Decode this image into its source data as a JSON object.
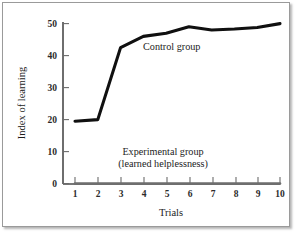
{
  "chart_data": {
    "type": "line",
    "title": "",
    "xlabel": "Trials",
    "ylabel": "Index of learning",
    "x": [
      1,
      2,
      3,
      4,
      5,
      6,
      7,
      8,
      9,
      10
    ],
    "xtick_labels": [
      "1",
      "2",
      "3",
      "4",
      "5",
      "6",
      "7",
      "8",
      "9",
      "10"
    ],
    "ytick_labels": [
      "0",
      "10",
      "20",
      "30",
      "40",
      "50"
    ],
    "yticks": [
      0,
      10,
      20,
      30,
      40,
      50
    ],
    "xlim": [
      1,
      10
    ],
    "ylim": [
      0,
      50
    ],
    "grid": false,
    "legend_position": "inline-annotation",
    "series": [
      {
        "name": "Control group",
        "values": [
          19.5,
          20.0,
          42.5,
          46.0,
          47.0,
          49.0,
          48.0,
          48.3,
          48.8,
          50.0
        ],
        "color": "#101010"
      },
      {
        "name": "Experimental group (learned helplessness)",
        "values": [
          0,
          0,
          0,
          0,
          0,
          0,
          0,
          0,
          0,
          0
        ],
        "color": "#6e6e6e"
      }
    ],
    "annotations": [
      {
        "id": "control-label",
        "text": "Control group"
      },
      {
        "id": "experimental-label-line1",
        "text": "Experimental group"
      },
      {
        "id": "experimental-label-line2",
        "text": "(learned helplessness)"
      }
    ]
  },
  "axes": {
    "y_title": "Index of learning",
    "x_title": "Trials"
  }
}
